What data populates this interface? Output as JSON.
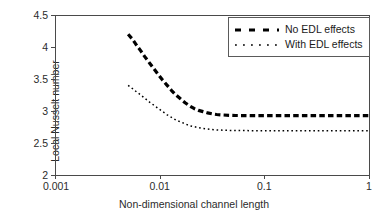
{
  "chart_data": {
    "type": "line",
    "title": "",
    "xlabel": "Non-dimensional channel length",
    "ylabel": "Local Nusselt number",
    "xscale": "log",
    "xlim": [
      0.001,
      1
    ],
    "ylim": [
      2,
      4.5
    ],
    "yticks": [
      "2",
      "2.5",
      "3",
      "3.5",
      "4",
      "4.5"
    ],
    "ytick_values": [
      2,
      2.5,
      3,
      3.5,
      4,
      4.5
    ],
    "xticks": [
      "0.001",
      "0.01",
      "0.1",
      "1"
    ],
    "xtick_values": [
      0.001,
      0.01,
      0.1,
      1
    ],
    "grid": false,
    "legend_position": "top-right",
    "series": [
      {
        "name": "No EDL effects",
        "style": "thick-dashed",
        "color": "#000000",
        "x": [
          0.005,
          0.0055,
          0.006,
          0.0066,
          0.0072,
          0.008,
          0.0088,
          0.0097,
          0.0107,
          0.0118,
          0.013,
          0.0143,
          0.0158,
          0.0175,
          0.0193,
          0.0213,
          0.0235,
          0.026,
          0.0287,
          0.0317,
          0.035,
          0.04,
          0.046,
          0.053,
          0.062,
          0.075,
          0.09,
          0.11,
          0.14,
          0.18,
          0.24,
          0.32,
          0.43,
          0.6,
          0.8,
          1.0
        ],
        "y": [
          4.2,
          4.12,
          4.03,
          3.94,
          3.85,
          3.75,
          3.66,
          3.57,
          3.48,
          3.4,
          3.32,
          3.25,
          3.19,
          3.13,
          3.08,
          3.04,
          3.01,
          2.99,
          2.97,
          2.955,
          2.945,
          2.938,
          2.933,
          2.93,
          2.929,
          2.928,
          2.928,
          2.928,
          2.928,
          2.928,
          2.928,
          2.928,
          2.928,
          2.928,
          2.928,
          2.928
        ]
      },
      {
        "name": "With EDL effects",
        "style": "fine-dotted",
        "color": "#000000",
        "x": [
          0.005,
          0.0055,
          0.006,
          0.0066,
          0.0072,
          0.008,
          0.0088,
          0.0097,
          0.0107,
          0.0118,
          0.013,
          0.0143,
          0.0158,
          0.0175,
          0.0193,
          0.0213,
          0.0235,
          0.026,
          0.0287,
          0.0317,
          0.035,
          0.04,
          0.046,
          0.053,
          0.062,
          0.075,
          0.09,
          0.11,
          0.14,
          0.18,
          0.24,
          0.32,
          0.43,
          0.6,
          0.8,
          1.0
        ],
        "y": [
          3.4,
          3.35,
          3.3,
          3.25,
          3.2,
          3.14,
          3.09,
          3.04,
          2.99,
          2.94,
          2.9,
          2.86,
          2.83,
          2.8,
          2.77,
          2.755,
          2.74,
          2.728,
          2.718,
          2.71,
          2.705,
          2.7,
          2.697,
          2.695,
          2.694,
          2.693,
          2.693,
          2.693,
          2.693,
          2.693,
          2.693,
          2.693,
          2.693,
          2.693,
          2.693,
          2.693
        ]
      }
    ]
  },
  "legend": {
    "items": [
      {
        "label": "No EDL effects"
      },
      {
        "label": "With EDL effects"
      }
    ]
  },
  "axes": {
    "y_title": "Local Nusselt number",
    "x_title": "Non-dimensional channel length"
  },
  "colors": {
    "axis": "#4a4a4a",
    "series": "#000000",
    "text": "#2b2b2b",
    "background": "#ffffff"
  }
}
